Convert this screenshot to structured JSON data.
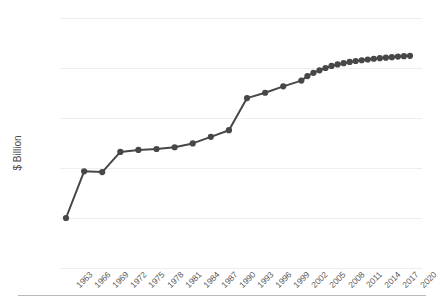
{
  "chart_data": {
    "type": "line",
    "title": "",
    "xlabel": "",
    "ylabel": "$ Billion",
    "yscale": "log",
    "ylim": [
      1,
      10000
    ],
    "ytick_labels": [
      "10,000",
      "1,000",
      "100",
      "10",
      "1",
      "0"
    ],
    "ytick_values": [
      10000,
      1000,
      100,
      10,
      1,
      0
    ],
    "xtick_labels": [
      "1963",
      "1966",
      "1969",
      "1972",
      "1975",
      "1978",
      "1981",
      "1984",
      "1987",
      "1990",
      "1993",
      "1996",
      "1999",
      "2002",
      "2005",
      "2008",
      "2011",
      "2014",
      "2017",
      "2020"
    ],
    "grid": true,
    "legend": false,
    "series": [
      {
        "name": "$ Billion",
        "color": "#474747",
        "marker": "circle",
        "x": [
          1963,
          1966,
          1969,
          1972,
          1975,
          1978,
          1981,
          1984,
          1987,
          1990,
          1993,
          1996,
          1999,
          2002,
          2003,
          2004,
          2005,
          2006,
          2007,
          2008,
          2009,
          2010,
          2011,
          2012,
          2013,
          2014,
          2015,
          2016,
          2017,
          2018,
          2019,
          2020
        ],
        "values": [
          1,
          8.6,
          8.3,
          21,
          23,
          24,
          26,
          31,
          42,
          57,
          250,
          320,
          430,
          560,
          690,
          800,
          900,
          1000,
          1100,
          1180,
          1250,
          1320,
          1380,
          1430,
          1480,
          1530,
          1570,
          1610,
          1650,
          1690,
          1720,
          1750
        ]
      }
    ]
  }
}
